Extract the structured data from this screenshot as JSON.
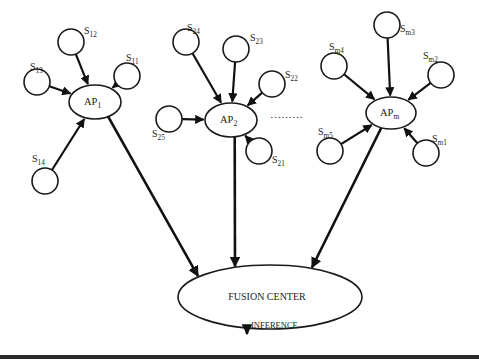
{
  "diagram": {
    "access_points": [
      {
        "id": "ap1",
        "label": "AP",
        "sub": "1",
        "cx": 95,
        "cy": 102,
        "rx": 26,
        "ry": 17
      },
      {
        "id": "ap2",
        "label": "AP",
        "sub": "2",
        "cx": 231,
        "cy": 120,
        "rx": 26,
        "ry": 17
      },
      {
        "id": "apm",
        "label": "AP",
        "sub": "m",
        "cx": 391,
        "cy": 113,
        "rx": 25,
        "ry": 16
      }
    ],
    "sensors": [
      {
        "id": "s12",
        "label": "S",
        "sub": "12",
        "cx": 71,
        "cy": 42,
        "ap": "ap1",
        "lx": 84,
        "ly": 34
      },
      {
        "id": "s11",
        "label": "S",
        "sub": "11",
        "cx": 127,
        "cy": 76,
        "ap": "ap1",
        "lx": 126,
        "ly": 61
      },
      {
        "id": "s13",
        "label": "S",
        "sub": "13",
        "cx": 37,
        "cy": 82,
        "ap": "ap1",
        "lx": 30,
        "ly": 70
      },
      {
        "id": "s14",
        "label": "S",
        "sub": "14",
        "cx": 45,
        "cy": 181,
        "ap": "ap1",
        "lx": 32,
        "ly": 162
      },
      {
        "id": "s24",
        "label": "S",
        "sub": "24",
        "cx": 186,
        "cy": 42,
        "ap": "ap2",
        "lx": 187,
        "ly": 31
      },
      {
        "id": "s23",
        "label": "S",
        "sub": "23",
        "cx": 236,
        "cy": 49,
        "ap": "ap2",
        "lx": 250,
        "ly": 41
      },
      {
        "id": "s22",
        "label": "S",
        "sub": "22",
        "cx": 272,
        "cy": 84,
        "ap": "ap2",
        "lx": 285,
        "ly": 78
      },
      {
        "id": "s25",
        "label": "S",
        "sub": "25",
        "cx": 169,
        "cy": 119,
        "ap": "ap2",
        "lx": 152,
        "ly": 137
      },
      {
        "id": "s21",
        "label": "S",
        "sub": "21",
        "cx": 259,
        "cy": 151,
        "ap": "ap2",
        "lx": 272,
        "ly": 163
      },
      {
        "id": "sm3",
        "label": "S",
        "sub": "m3",
        "cx": 387,
        "cy": 25,
        "ap": "apm",
        "lx": 400,
        "ly": 32
      },
      {
        "id": "sm4",
        "label": "S",
        "sub": "m4",
        "cx": 334,
        "cy": 66,
        "ap": "apm",
        "lx": 329,
        "ly": 50
      },
      {
        "id": "sm2",
        "label": "S",
        "sub": "m2",
        "cx": 441,
        "cy": 75,
        "ap": "apm",
        "lx": 423,
        "ly": 59
      },
      {
        "id": "sm5",
        "label": "S",
        "sub": "m5",
        "cx": 330,
        "cy": 151,
        "ap": "apm",
        "lx": 318,
        "ly": 135
      },
      {
        "id": "sm1",
        "label": "S",
        "sub": "m1",
        "cx": 426,
        "cy": 153,
        "ap": "apm",
        "lx": 432,
        "ly": 142
      }
    ],
    "sensor_radius": 13,
    "ellipsis": "………",
    "fusion_center": {
      "label": "FUSION CENTER",
      "cx": 270,
      "cy": 297,
      "rx": 92,
      "ry": 32
    },
    "output": {
      "label": "INFERENCE"
    }
  }
}
